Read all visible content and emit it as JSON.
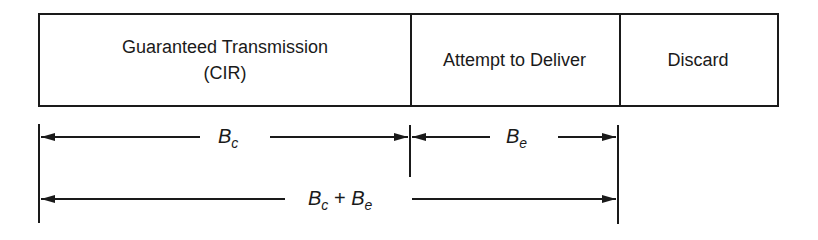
{
  "segments": [
    {
      "line1": "Guaranteed Transmission",
      "line2": "(CIR)"
    },
    {
      "line1": "Attempt to Deliver"
    },
    {
      "line1": "Discard"
    }
  ],
  "dimensions": {
    "bc": {
      "base": "B",
      "sub": "c"
    },
    "be": {
      "base": "B",
      "sub": "e"
    },
    "total": {
      "a_base": "B",
      "a_sub": "c",
      "plus": "+",
      "b_base": "B",
      "b_sub": "e"
    }
  },
  "colors": {
    "line": "#1a1a1a",
    "background": "#ffffff"
  }
}
